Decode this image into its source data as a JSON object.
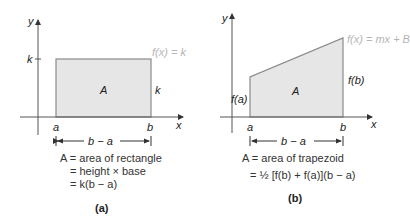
{
  "colors": {
    "fill": "#e6e6e6",
    "edge": "#8a8a8a",
    "axis": "#555555",
    "text": "#222222",
    "curve_label": "#b5b5b5"
  },
  "panel_a": {
    "caption": "(a)",
    "y_axis_label": "y",
    "x_axis_label": "x",
    "y_tick_label": "k",
    "function_label": "f(x) = k",
    "region_label": "A",
    "height_label": "k",
    "left_x_label": "a",
    "right_x_label": "b",
    "width_label": "b − a",
    "equations": [
      "A = area of rectangle",
      "= height × base",
      "= k(b − a)"
    ]
  },
  "panel_b": {
    "caption": "(b)",
    "y_axis_label": "y",
    "x_axis_label": "x",
    "function_label": "f(x) = mx + B",
    "region_label": "A",
    "left_height_label": "f(a)",
    "right_height_label": "f(b)",
    "left_x_label": "a",
    "right_x_label": "b",
    "width_label": "b − a",
    "equations": [
      "A = area of trapezoid",
      "= ½ [f(b) + f(a)](b − a)"
    ]
  }
}
